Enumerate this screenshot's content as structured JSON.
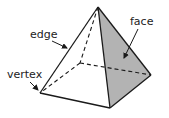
{
  "diagram": {
    "labels": {
      "edge": "edge",
      "vertex": "vertex",
      "face": "face"
    },
    "colors": {
      "line": "#1a1a1a",
      "face_fill": "#b3b3b3",
      "background": "#ffffff",
      "text": "#222222"
    }
  }
}
